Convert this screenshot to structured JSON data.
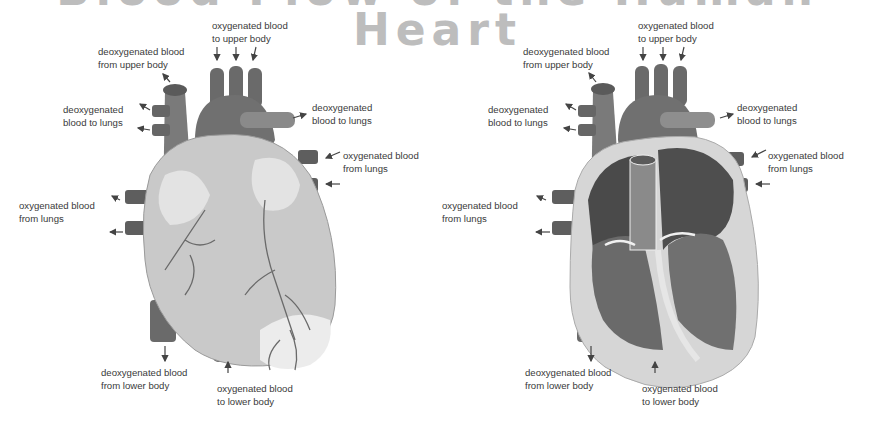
{
  "title": {
    "text": "Blood Flow of the Human Heart",
    "clipped": true
  },
  "panels": [
    {
      "name": "exterior-view",
      "labels": {
        "oxy_upper": "oxygenated blood\nto upper body",
        "deoxy_upper": "deoxygenated blood\nfrom upper body",
        "deoxy_lungs_left": "deoxygenated\nblood to lungs",
        "deoxy_lungs_right": "deoxygenated\nblood to lungs",
        "oxy_from_lungs_right": "oxygenated blood\nfrom lungs",
        "oxy_from_lungs_left": "oxygenated blood\nfrom lungs",
        "deoxy_lower": "deoxygenated blood\nfrom lower body",
        "oxy_lower": "oxygenated blood\nto lower body"
      }
    },
    {
      "name": "cross-section-view",
      "labels": {
        "oxy_upper": "oxygenated blood\nto upper body",
        "deoxy_upper": "deoxygenated blood\nfrom upper body",
        "deoxy_lungs_left": "deoxygenated\nblood to lungs",
        "deoxy_lungs_right": "deoxygenated\nblood to lungs",
        "oxy_from_lungs_right": "oxygenated blood\nfrom lungs",
        "oxy_from_lungs_left": "oxygenated blood\nfrom lungs",
        "deoxy_lower": "deoxygenated blood\nfrom lower body",
        "oxy_lower": "oxygenated blood\nto lower body"
      }
    }
  ],
  "colors": {
    "vessel": "#6e6e6e",
    "vessel_dark": "#555555",
    "muscle": "#cfcfcf",
    "chamber": "#5a5a5a",
    "arrow": "#444444",
    "text": "#3a3a3a"
  }
}
